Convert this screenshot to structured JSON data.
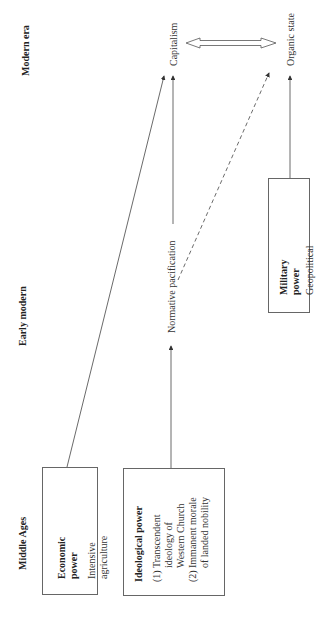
{
  "eras": {
    "modern": "Modern era",
    "early_modern": "Early modern",
    "middle_ages": "Middle Ages"
  },
  "nodes": {
    "capitalism": "Capitalism",
    "organic_state": "Organic state",
    "normative_pacification": "Normative pacification"
  },
  "boxes": {
    "economic": {
      "title": "Economic power",
      "subtitle": "Intensive agriculture"
    },
    "ideological": {
      "title": "Ideological power",
      "items": [
        {
          "num": "(1)",
          "text": "Transcendent ideology of Western Church"
        },
        {
          "num": "(2)",
          "text": "Immanent morale of landed nobility"
        }
      ]
    },
    "military": {
      "title": "Military power",
      "subtitle": "Geopolitical competition"
    }
  },
  "edges": [
    {
      "from": "Economic power",
      "to": "Capitalism",
      "style": "solid"
    },
    {
      "from": "Ideological power",
      "to": "Normative pacification",
      "style": "solid"
    },
    {
      "from": "Normative pacification",
      "to": "Capitalism",
      "style": "solid"
    },
    {
      "from": "Normative pacification",
      "to": "Organic state",
      "style": "dashed"
    },
    {
      "from": "Military power",
      "to": "Organic state",
      "style": "solid"
    },
    {
      "from": "Capitalism",
      "to": "Organic state",
      "style": "double-headed-hollow"
    }
  ]
}
